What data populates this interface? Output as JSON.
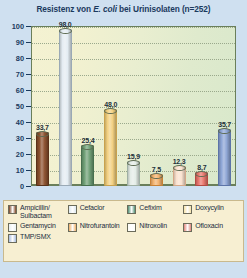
{
  "chart_data": {
    "type": "bar",
    "title": "Resistenz von E. coli bei Urinisolaten (n=252)",
    "title_parts": {
      "before": "Resistenz von ",
      "italic": "E. coli",
      "after": " bei Urinisolaten (n=252)"
    },
    "sample_size": "n=252",
    "xlabel": "",
    "ylabel": "",
    "ylim": [
      0,
      100
    ],
    "ytick_step": 10,
    "yticks": [
      "100",
      "90",
      "80",
      "70",
      "60",
      "50",
      "40",
      "30",
      "20",
      "10",
      "0"
    ],
    "grid": true,
    "legend_position": "bottom",
    "categories": [
      "Ampicillin/Sulbactam",
      "Cefaclor",
      "Cefixim",
      "Doxycylin",
      "Gentamycin",
      "Nitrofurantoin",
      "Nitroxolin",
      "Ofloxacin",
      "TMP/SMX"
    ],
    "values": [
      33.7,
      98.0,
      25.4,
      48.0,
      15.9,
      7.5,
      12.3,
      8.7,
      35.7
    ],
    "value_labels": [
      "33,7",
      "98,0",
      "25,4",
      "48,0",
      "15,9",
      "7,5",
      "12,3",
      "8,7",
      "35,7"
    ],
    "colors": [
      "#8a4e2a",
      "#e3ecf2",
      "#6d9e74",
      "#f2cf7e",
      "#e3ece6",
      "#f3b06a",
      "#fae0cd",
      "#e8736a",
      "#8ba3d4"
    ],
    "bar_borders": [
      "#5a3219",
      "#9aa9b5",
      "#47704e",
      "#c9a24d",
      "#9fb0a4",
      "#c98134",
      "#d6a887",
      "#b44a42",
      "#5c74a8"
    ]
  },
  "legend": {
    "rows": [
      [
        {
          "label": "Ampicillin/\nSulbactam",
          "color": "#7b4323"
        },
        {
          "label": "Cefaclor",
          "color": "#dde8f0"
        },
        {
          "label": "Cefixim",
          "color": "#4f8e72"
        },
        {
          "label": "Doxycylin",
          "color": "#f6e2a8"
        }
      ],
      [
        {
          "label": "Gentamycin",
          "color": "#e8f0f2"
        },
        {
          "label": "Nitrofurantoin",
          "color": "#f0b169"
        },
        {
          "label": "Nitroxolin",
          "color": "#fdfcf7"
        },
        {
          "label": "Ofloxacin",
          "color": "#e0867c"
        }
      ],
      [
        {
          "label": "TMP/SMX",
          "color": "#a9bde0"
        }
      ]
    ]
  },
  "theme": {
    "page_background": "#cfe0f0",
    "legend_background": "#f7efd2",
    "plot_background_left": "#f4f2d2",
    "plot_background_right": "#d8e8cb",
    "axis_color": "#1b3a5e",
    "title_color": "#1b3a5e"
  }
}
